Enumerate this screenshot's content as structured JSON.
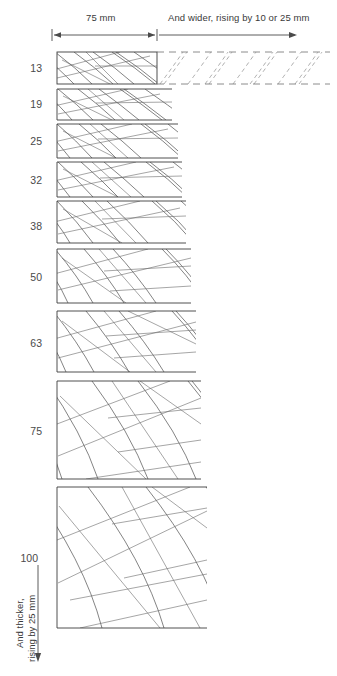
{
  "diagram": {
    "header": {
      "left_span_label": "75 mm",
      "right_span_label": "And wider, rising by 10 or 25 mm"
    },
    "vertical_axis": {
      "line1": "And thicker,",
      "line2": "rising by 25 mm"
    },
    "row_labels": [
      "13",
      "19",
      "25",
      "32",
      "38",
      "50",
      "63",
      "75",
      "100"
    ],
    "colors": {
      "line": "#4f4f4f",
      "frame": "#3c3c3c",
      "dashed": "#6f6f6f",
      "text": "#3a3a3a",
      "background": "#ffffff"
    },
    "rows": [
      {
        "label": "13",
        "top": 52,
        "bottom": 84,
        "right": 157,
        "closed_right": true,
        "dashed_extension": true
      },
      {
        "label": "19",
        "top": 89,
        "bottom": 120,
        "right": 172,
        "closed_right": false,
        "dashed_extension": false
      },
      {
        "label": "25",
        "top": 124,
        "bottom": 158,
        "right": 178,
        "closed_right": false,
        "dashed_extension": false
      },
      {
        "label": "32",
        "top": 162,
        "bottom": 197,
        "right": 182,
        "closed_right": false,
        "dashed_extension": false
      },
      {
        "label": "38",
        "top": 201,
        "bottom": 243,
        "right": 186,
        "closed_right": false,
        "dashed_extension": false
      },
      {
        "label": "50",
        "top": 249,
        "bottom": 303,
        "right": 191,
        "closed_right": false,
        "dashed_extension": false
      },
      {
        "label": "63",
        "top": 311,
        "bottom": 372,
        "right": 196,
        "closed_right": false,
        "dashed_extension": false
      },
      {
        "label": "75",
        "top": 381,
        "bottom": 479,
        "right": 201,
        "closed_right": false,
        "dashed_extension": false
      },
      {
        "label": "100",
        "top": 487,
        "bottom": 628,
        "right": 207,
        "closed_right": false,
        "dashed_extension": false
      }
    ],
    "axis_marks": {
      "left_tick_x": 52,
      "mid_tick_x": 157,
      "right_arrow_x": 297,
      "arrow_y": 35,
      "vertical_arrow_x": 38,
      "vertical_arrow_top": 565,
      "vertical_arrow_bottom": 662
    }
  }
}
